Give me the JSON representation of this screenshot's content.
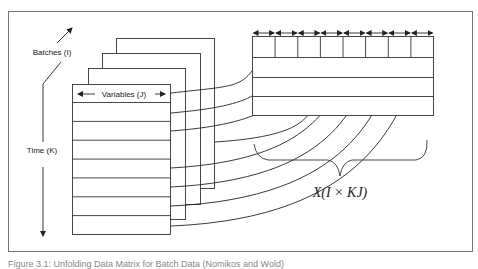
{
  "figure": {
    "labels": {
      "batches": "Batches (I)",
      "variables": "Variables (J)",
      "time": "Time (K)",
      "unfolded_matrix": "X(I × KJ)"
    },
    "caption": "Figure 3.1: Unfolding Data Matrix for Batch Data (Nomikos and Wold)",
    "stack": {
      "sheet_count": 4,
      "rows_per_sheet": 8
    },
    "unfolded": {
      "columns": 8,
      "rows": 4
    },
    "colors": {
      "stroke": "#222222",
      "frame": "#777777",
      "background": "#ffffff"
    }
  }
}
